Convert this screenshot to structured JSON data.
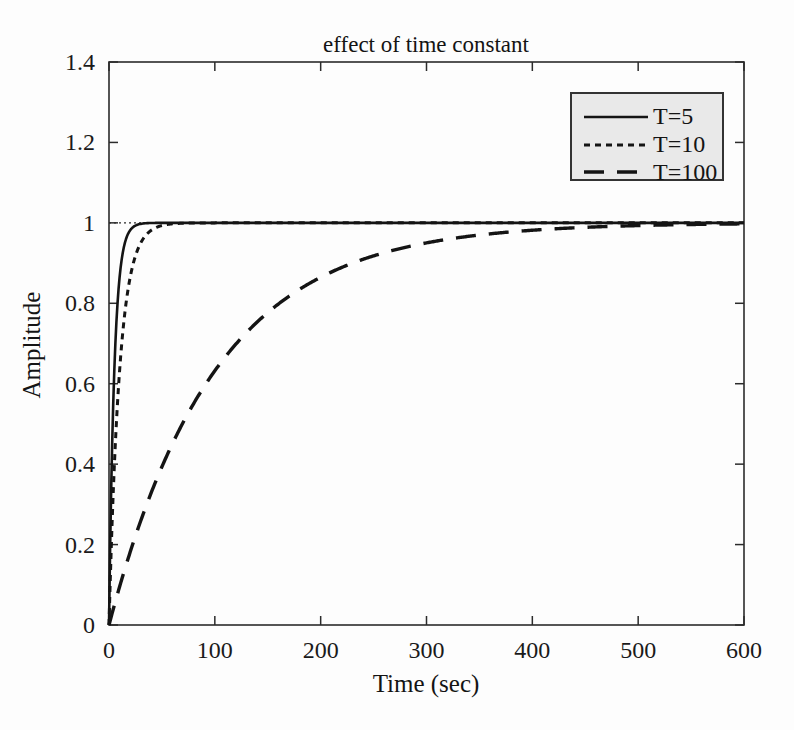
{
  "chart_data": {
    "type": "line",
    "title": "effect of time constant",
    "xlabel": "Time (sec)",
    "ylabel": "Amplitude",
    "xlim": [
      0,
      600
    ],
    "ylim": [
      0,
      1.4
    ],
    "xticks": [
      0,
      100,
      200,
      300,
      400,
      500,
      600
    ],
    "xticklabels": [
      "0",
      "100",
      "200",
      "300",
      "400",
      "500",
      "600"
    ],
    "yticks": [
      0,
      0.2,
      0.4,
      0.6,
      0.8,
      1,
      1.2,
      1.4
    ],
    "yticklabels": [
      "0",
      "0.2",
      "0.4",
      "0.6",
      "0.8",
      "1",
      "1.2",
      "1.4"
    ],
    "grid": false,
    "legend_position": "upper right",
    "reference_line": {
      "value": 1,
      "style": "dotted",
      "label": "steady state = 1"
    },
    "series": [
      {
        "name": "T=5",
        "legend_label": "T=5",
        "style": "solid",
        "color": "#141414",
        "time_constant": 5,
        "x": [
          0,
          2,
          4,
          6,
          8,
          10,
          12,
          15,
          18,
          21,
          25,
          30,
          35,
          40,
          50,
          60,
          80,
          100,
          150,
          200,
          300,
          400,
          500,
          600
        ],
        "y": [
          0,
          0.33,
          0.551,
          0.699,
          0.798,
          0.865,
          0.909,
          0.95,
          0.973,
          0.985,
          0.993,
          0.998,
          0.999,
          1,
          1,
          1,
          1,
          1,
          1,
          1,
          1,
          1,
          1,
          1
        ]
      },
      {
        "name": "T=10",
        "legend_label": "T=10",
        "style": "dashed-short",
        "color": "#141414",
        "time_constant": 10,
        "x": [
          0,
          4,
          8,
          12,
          16,
          20,
          25,
          30,
          35,
          40,
          45,
          50,
          60,
          70,
          80,
          100,
          150,
          200,
          300,
          400,
          500,
          600
        ],
        "y": [
          0,
          0.33,
          0.551,
          0.699,
          0.798,
          0.865,
          0.918,
          0.95,
          0.97,
          0.982,
          0.989,
          0.993,
          0.998,
          0.999,
          1,
          1,
          1,
          1,
          1,
          1,
          1,
          1
        ]
      },
      {
        "name": "T=100",
        "legend_label": "T=100",
        "style": "dashed-long",
        "color": "#141414",
        "time_constant": 100,
        "x": [
          0,
          20,
          40,
          60,
          80,
          100,
          125,
          150,
          175,
          200,
          250,
          300,
          350,
          400,
          450,
          500,
          550,
          600
        ],
        "y": [
          0,
          0.181,
          0.33,
          0.451,
          0.551,
          0.632,
          0.713,
          0.777,
          0.826,
          0.865,
          0.918,
          0.95,
          0.97,
          0.982,
          0.989,
          0.993,
          0.996,
          0.9975
        ]
      }
    ],
    "legend_entries": [
      {
        "label": "T=5",
        "style": "solid"
      },
      {
        "label": "T=10",
        "style": "dashed-short"
      },
      {
        "label": "T=100",
        "style": "dashed-long"
      }
    ],
    "colors": {
      "background": "#fdfdfd",
      "axis": "#2b2b2b",
      "curve": "#141414",
      "legend_fill": "#e9e9e9",
      "legend_border": "#333333"
    }
  }
}
